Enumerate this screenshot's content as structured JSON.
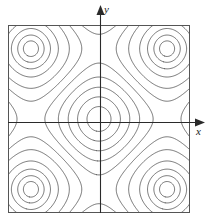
{
  "figure": {
    "name": "contour-plot",
    "background_color": "#ffffff",
    "line_color": "#3a3a3a",
    "frame_color": "#555555",
    "axis_color": "#2a2a2a",
    "line_width": 0.7,
    "frame": {
      "x": 8,
      "y": 25,
      "width": 182,
      "height": 188
    },
    "origin": {
      "x": 100,
      "y": 122
    }
  },
  "axes": {
    "x_label": "x",
    "y_label": "y",
    "x_arrow": "arrow-right",
    "y_arrow": "arrow-up"
  },
  "chart_data": {
    "type": "contour",
    "title": "",
    "xlabel": "x",
    "ylabel": "y",
    "function": "cos(x) + cos(y)",
    "xlim": [
      -4.2,
      4.2
    ],
    "ylim": [
      -4.2,
      4.2
    ],
    "grid": false,
    "legend": false,
    "center_feature": "local maximum at origin",
    "corner_feature": "saddle regions toward corners",
    "levels": [
      1.85,
      1.55,
      1.15,
      0.7,
      0.2,
      -0.3,
      -0.8,
      -1.3,
      -1.62,
      -1.82,
      -1.94
    ],
    "closed_contours_around_origin": 4,
    "crossings_on_positive_x_axis": 5,
    "crossings_on_positive_y_axis": 5
  }
}
